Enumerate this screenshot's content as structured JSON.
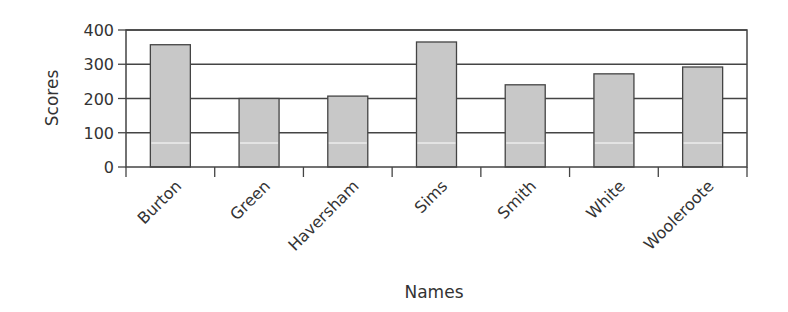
{
  "chart_data": {
    "type": "bar",
    "title": "",
    "xlabel": "Names",
    "ylabel": "Scores",
    "categories": [
      "Burton",
      "Green",
      "Haversham",
      "Sims",
      "Smith",
      "White",
      "Wooleroote"
    ],
    "values": [
      357,
      200,
      207,
      365,
      240,
      272,
      292
    ],
    "ylim": [
      0,
      400
    ],
    "yticks": [
      0,
      100,
      200,
      300,
      400
    ],
    "grid": true,
    "legend": null
  },
  "colors": {
    "bar_fill": "#c8c8c8",
    "bar_stroke": "#444444",
    "grid": "#444444",
    "text": "#333333"
  }
}
